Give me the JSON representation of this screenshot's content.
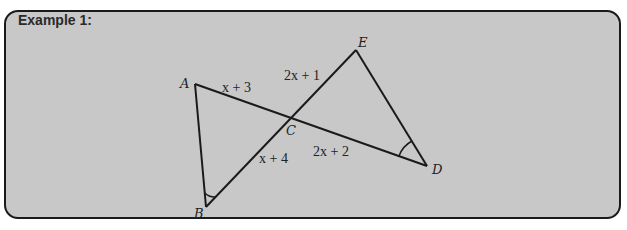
{
  "example": {
    "title": "Example 1:",
    "background_color": "#c8c8c8",
    "border_color": "#1a1a1a"
  },
  "figure": {
    "type": "geometry-diagram",
    "vertices": {
      "A": {
        "label": "A",
        "x": 195,
        "y": 84
      },
      "B": {
        "label": "B",
        "x": 206,
        "y": 207
      },
      "C": {
        "label": "C",
        "x": 290,
        "y": 118
      },
      "D": {
        "label": "D",
        "x": 427,
        "y": 166
      },
      "E": {
        "label": "E",
        "x": 356,
        "y": 50
      }
    },
    "segments": [
      {
        "from": "A",
        "to": "D"
      },
      {
        "from": "B",
        "to": "E"
      },
      {
        "from": "A",
        "to": "B"
      },
      {
        "from": "E",
        "to": "D"
      }
    ],
    "angle_marks": [
      {
        "vertex": "B"
      },
      {
        "vertex": "D"
      }
    ],
    "lengths": {
      "AC": "x + 3",
      "EC": "2x + 1",
      "BC": "x + 4",
      "CD": "2x + 2"
    }
  }
}
